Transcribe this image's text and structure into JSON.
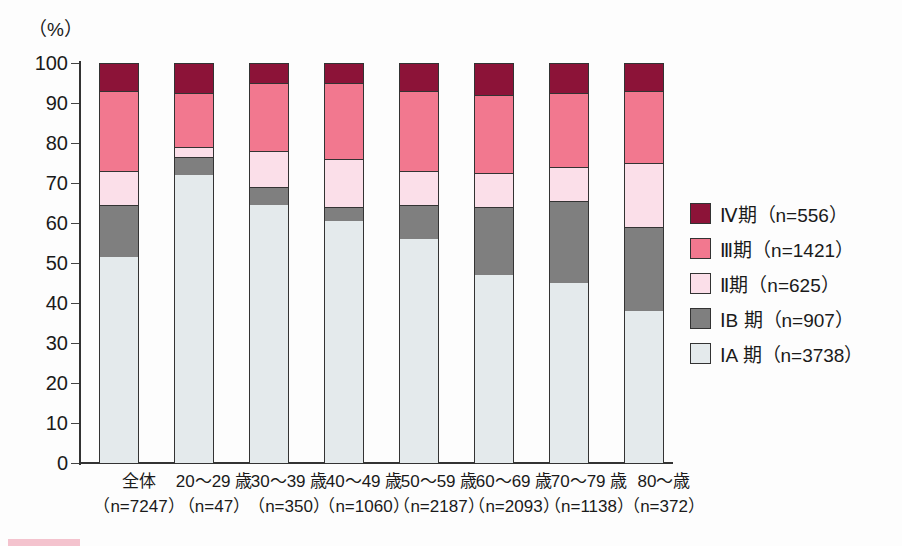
{
  "axis": {
    "y_unit_label": "（%）",
    "y_ticks": [
      0,
      10,
      20,
      30,
      40,
      50,
      60,
      70,
      80,
      90,
      100
    ],
    "y_max": 100,
    "y_min": 0
  },
  "colors": {
    "stage4": "#8c1338",
    "stage3": "#f2788f",
    "stage2": "#fbdfe9",
    "stage1b": "#7f7f7f",
    "stage1a": "#e4eaec",
    "outline": "#333333",
    "background": "#fdfdfd"
  },
  "legend": {
    "items": [
      {
        "key": "stage4",
        "label": "Ⅳ期（n=556）",
        "color": "#8c1338"
      },
      {
        "key": "stage3",
        "label": "Ⅲ期（n=1421）",
        "color": "#f2788f"
      },
      {
        "key": "stage2",
        "label": "Ⅱ期（n=625）",
        "color": "#fbdfe9"
      },
      {
        "key": "stage1b",
        "label": "ⅠB 期（n=907）",
        "color": "#7f7f7f"
      },
      {
        "key": "stage1a",
        "label": "ⅠA 期（n=3738）",
        "color": "#e4eaec"
      }
    ]
  },
  "x_labels": [
    {
      "line1": "全体",
      "line2": "（n=7247）"
    },
    {
      "line1": "20〜29 歳",
      "line2": "（n=47）"
    },
    {
      "line1": "30〜39 歳",
      "line2": "（n=350）"
    },
    {
      "line1": "40〜49 歳",
      "line2": "（n=1060）"
    },
    {
      "line1": "50〜59 歳",
      "line2": "（n=2187）"
    },
    {
      "line1": "60〜69 歳",
      "line2": "（n=2093）"
    },
    {
      "line1": "70〜79 歳",
      "line2": "（n=1138）"
    },
    {
      "line1": "80〜歳",
      "line2": "（n=372）"
    }
  ],
  "chart_data": {
    "type": "bar",
    "subtype": "stacked-100-percent",
    "title": "",
    "xlabel": "",
    "ylabel": "（%）",
    "ylim": [
      0,
      100
    ],
    "grid": false,
    "legend_position": "right",
    "categories": [
      "全体（n=7247）",
      "20〜29 歳（n=47）",
      "30〜39 歳（n=350）",
      "40〜49 歳（n=1060）",
      "50〜59 歳（n=2187）",
      "60〜69 歳（n=2093）",
      "70〜79 歳（n=1138）",
      "80〜歳（n=372）"
    ],
    "series": [
      {
        "name": "ⅠA 期（n=3738）",
        "color": "#e4eaec",
        "values": [
          51.5,
          72.0,
          64.5,
          60.5,
          56.0,
          47.0,
          45.0,
          38.0
        ]
      },
      {
        "name": "ⅠB 期（n=907）",
        "color": "#7f7f7f",
        "values": [
          13.0,
          4.5,
          4.5,
          3.5,
          8.5,
          17.0,
          20.5,
          21.0
        ]
      },
      {
        "name": "Ⅱ期（n=625）",
        "color": "#fbdfe9",
        "values": [
          8.5,
          2.5,
          9.0,
          12.0,
          8.5,
          8.5,
          8.5,
          16.0
        ]
      },
      {
        "name": "Ⅲ期（n=1421）",
        "color": "#f2788f",
        "values": [
          20.0,
          13.5,
          17.0,
          19.0,
          20.0,
          19.5,
          18.5,
          18.0
        ]
      },
      {
        "name": "Ⅳ期（n=556）",
        "color": "#8c1338",
        "values": [
          7.0,
          7.5,
          5.0,
          5.0,
          7.0,
          8.0,
          7.5,
          7.0
        ]
      }
    ],
    "cumulative_tops": [
      {
        "category": "全体（n=7247）",
        "ia": 51.5,
        "ib": 64.5,
        "ii": 73.0,
        "iii": 93.0,
        "iv": 100
      },
      {
        "category": "20〜29 歳（n=47）",
        "ia": 72.0,
        "ib": 76.5,
        "ii": 79.0,
        "iii": 92.5,
        "iv": 100
      },
      {
        "category": "30〜39 歳（n=350）",
        "ia": 64.5,
        "ib": 69.0,
        "ii": 78.0,
        "iii": 95.0,
        "iv": 100
      },
      {
        "category": "40〜49 歳（n=1060）",
        "ia": 60.5,
        "ib": 64.0,
        "ii": 76.0,
        "iii": 95.0,
        "iv": 100
      },
      {
        "category": "50〜59 歳（n=2187）",
        "ia": 56.0,
        "ib": 64.5,
        "ii": 73.0,
        "iii": 93.0,
        "iv": 100
      },
      {
        "category": "60〜69 歳（n=2093）",
        "ia": 47.0,
        "ib": 64.0,
        "ii": 72.5,
        "iii": 92.0,
        "iv": 100
      },
      {
        "category": "70〜79 歳（n=1138）",
        "ia": 45.0,
        "ib": 65.5,
        "ii": 74.0,
        "iii": 92.5,
        "iv": 100
      },
      {
        "category": "80〜歳（n=372）",
        "ia": 38.0,
        "ib": 59.0,
        "ii": 75.0,
        "iii": 93.0,
        "iv": 100
      }
    ]
  }
}
